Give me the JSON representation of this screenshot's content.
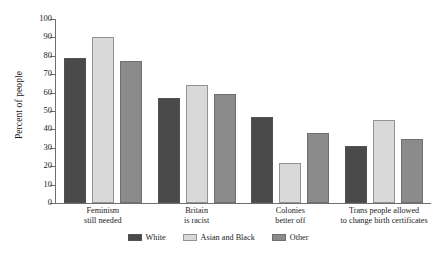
{
  "chart_data": {
    "type": "bar",
    "title": "",
    "xlabel": "",
    "ylabel": "Percent of people",
    "ylim": [
      0,
      100
    ],
    "yticks": [
      0,
      10,
      20,
      30,
      40,
      50,
      60,
      70,
      80,
      90,
      100
    ],
    "grid": false,
    "legend_position": "bottom",
    "categories": [
      "Feminism still needed",
      "Britain is racist",
      "Colonies better off",
      "Trans people allowed to change birth certificates"
    ],
    "category_lines": [
      [
        "Feminism",
        "still needed"
      ],
      [
        "Britain",
        "is racist"
      ],
      [
        "Colonies",
        "better off"
      ],
      [
        "Trans people allowed",
        "to change birth certificates"
      ]
    ],
    "series": [
      {
        "name": "White",
        "color": "#4a4a4a",
        "values": [
          79,
          57,
          47,
          31
        ]
      },
      {
        "name": "Asian and Black",
        "color": "#d9d9d9",
        "values": [
          90,
          64,
          22,
          45
        ]
      },
      {
        "name": "Other",
        "color": "#8b8b8b",
        "values": [
          77,
          59,
          38,
          35
        ]
      }
    ]
  }
}
